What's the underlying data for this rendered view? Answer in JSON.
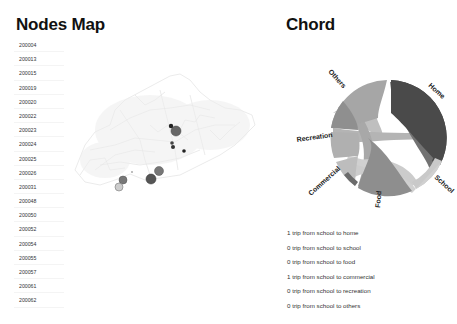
{
  "nodes_panel": {
    "title": "Nodes Map",
    "node_ids": [
      "200004",
      "200013",
      "200015",
      "200019",
      "200020",
      "200022",
      "200023",
      "200024",
      "200025",
      "200026",
      "200031",
      "200048",
      "200050",
      "200052",
      "200054",
      "200055",
      "200057",
      "200061",
      "200062"
    ]
  },
  "map": {
    "description": "Grey road network map with node markers",
    "marker_color": "#555555",
    "network_color": "#d8d8d8"
  },
  "chord_panel": {
    "title": "Chord",
    "groups": [
      {
        "label": "Home",
        "color": "#4a4a4a"
      },
      {
        "label": "School",
        "color": "#c9c9c9"
      },
      {
        "label": "Food",
        "color": "#8e8e8e"
      },
      {
        "label": "Commercial",
        "color": "#bdbdbd"
      },
      {
        "label": "Recreation",
        "color": "#b0b0b0"
      },
      {
        "label": "Others",
        "color": "#a6a6a6"
      }
    ]
  },
  "trips": [
    {
      "text": "1 trip from school to home"
    },
    {
      "text": "0 trip from school to school"
    },
    {
      "text": "0 trip from school to food"
    },
    {
      "text": "1 trip from school to commercial"
    },
    {
      "text": "0 trip from school to recreation"
    },
    {
      "text": "0 trip from school to others"
    }
  ]
}
